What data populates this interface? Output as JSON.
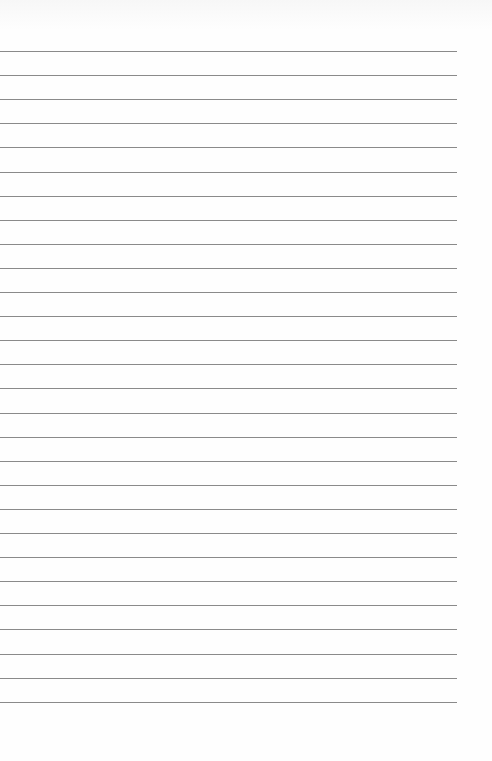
{
  "page": {
    "type": "lined-paper",
    "background": "#fdfdfd",
    "line_color": "#8a8a8a",
    "line_count": 28,
    "first_line_y": 51,
    "line_spacing": 24.1,
    "line_left": 0,
    "line_right": 457
  }
}
